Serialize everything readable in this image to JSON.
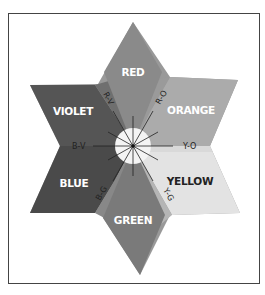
{
  "diagram": {
    "type": "color-star",
    "colors": {
      "red": "#8a8a8a",
      "orange": "#aaaaaa",
      "yellow": "#e2e2e2",
      "green": "#7c7c7c",
      "blue": "#4a4a4a",
      "violet": "#555555",
      "frame": "#444444",
      "center": "#f4f4f4"
    },
    "primary_secondary": [
      {
        "id": "red",
        "label": "RED"
      },
      {
        "id": "orange",
        "label": "ORANGE"
      },
      {
        "id": "yellow",
        "label": "YELLOW"
      },
      {
        "id": "green",
        "label": "GREEN"
      },
      {
        "id": "blue",
        "label": "BLUE"
      },
      {
        "id": "violet",
        "label": "VIOLET"
      }
    ],
    "tertiary": [
      {
        "id": "r-v",
        "label": "R-V"
      },
      {
        "id": "r-o",
        "label": "R-O"
      },
      {
        "id": "y-o",
        "label": "Y-O"
      },
      {
        "id": "y-g",
        "label": "Y-G"
      },
      {
        "id": "b-g",
        "label": "B-G"
      },
      {
        "id": "b-v",
        "label": "B-V"
      }
    ]
  }
}
